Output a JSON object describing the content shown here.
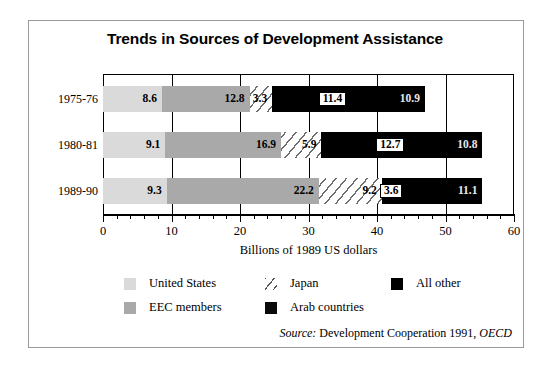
{
  "chart_data": {
    "type": "bar",
    "orientation": "horizontal",
    "stacked": true,
    "title": "Trends in Sources of Development Assistance",
    "xlabel": "Billions of 1989 US dollars",
    "ylabel": "",
    "xlim": [
      0,
      60
    ],
    "xticks": [
      0,
      10,
      20,
      30,
      40,
      50,
      60
    ],
    "xtick_labels": [
      "0",
      "10",
      "20",
      "30",
      "40",
      "50",
      "60"
    ],
    "minor_tick_step": 2,
    "grid": true,
    "legend_position": "bottom",
    "categories": [
      "1975-76",
      "1980-81",
      "1989-90"
    ],
    "series": [
      {
        "name": "United States",
        "values": [
          8.6,
          9.1,
          9.3
        ],
        "color": "#dadada",
        "pattern": "solid"
      },
      {
        "name": "EEC members",
        "values": [
          12.8,
          16.9,
          22.2
        ],
        "color": "#a9a9a9",
        "pattern": "solid"
      },
      {
        "name": "Japan",
        "values": [
          3.3,
          5.9,
          9.2
        ],
        "color": "#ffffff",
        "pattern": "diagonal-hatch"
      },
      {
        "name": "Arab countries",
        "values": [
          11.4,
          12.7,
          3.6
        ],
        "color": "#000000",
        "pattern": "solid"
      },
      {
        "name": "All other",
        "values": [
          10.9,
          10.8,
          11.1
        ],
        "color": "#000000",
        "pattern": "solid"
      }
    ],
    "row_totals": [
      47.0,
      55.4,
      55.4
    ],
    "source": "Development Cooperation 1991, OECD"
  },
  "title": "Trends in Sources of Development Assistance",
  "axis": {
    "x_title": "Billions of 1989 US dollars",
    "ticks": [
      {
        "label": "0",
        "value": 0
      },
      {
        "label": "10",
        "value": 10
      },
      {
        "label": "20",
        "value": 20
      },
      {
        "label": "30",
        "value": 30
      },
      {
        "label": "40",
        "value": 40
      },
      {
        "label": "50",
        "value": 50
      },
      {
        "label": "60",
        "value": 60
      }
    ]
  },
  "rows": [
    {
      "category": "1975-76",
      "segments": [
        {
          "series": "United States",
          "value": 8.6,
          "label": "8.6"
        },
        {
          "series": "EEC members",
          "value": 12.8,
          "label": "12.8"
        },
        {
          "series": "Japan",
          "value": 3.3,
          "label": "3.3"
        },
        {
          "series": "Arab countries",
          "value": 11.4,
          "label": "11.4"
        },
        {
          "series": "All other",
          "value": 10.9,
          "label": "10.9"
        }
      ]
    },
    {
      "category": "1980-81",
      "segments": [
        {
          "series": "United States",
          "value": 9.1,
          "label": "9.1"
        },
        {
          "series": "EEC members",
          "value": 16.9,
          "label": "16.9"
        },
        {
          "series": "Japan",
          "value": 5.9,
          "label": "5.9"
        },
        {
          "series": "Arab countries",
          "value": 12.7,
          "label": "12.7"
        },
        {
          "series": "All other",
          "value": 10.8,
          "label": "10.8"
        }
      ]
    },
    {
      "category": "1989-90",
      "segments": [
        {
          "series": "United States",
          "value": 9.3,
          "label": "9.3"
        },
        {
          "series": "EEC members",
          "value": 22.2,
          "label": "22.2"
        },
        {
          "series": "Japan",
          "value": 9.2,
          "label": "9.2"
        },
        {
          "series": "Arab countries",
          "value": 3.6,
          "label": "3.6"
        },
        {
          "series": "All other",
          "value": 11.1,
          "label": "11.1"
        }
      ]
    }
  ],
  "legend": [
    {
      "label": "United States",
      "swatch": "us"
    },
    {
      "label": "EEC members",
      "swatch": "eec"
    },
    {
      "label": "Japan",
      "swatch": "japan"
    },
    {
      "label": "Arab countries",
      "swatch": "arab"
    },
    {
      "label": "All other",
      "swatch": "other"
    }
  ],
  "source": {
    "prefix": "Source:",
    "text": "Development Cooperation 1991,",
    "org": "OECD"
  }
}
